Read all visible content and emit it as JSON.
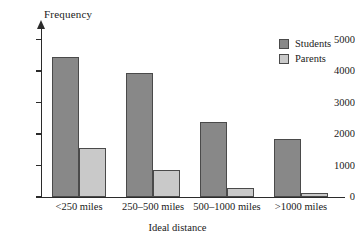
{
  "chart_data": {
    "type": "bar",
    "title": "",
    "xlabel": "Ideal distance",
    "ylabel": "Frequency",
    "categories": [
      "<250 miles",
      "250–500 miles",
      "500–1000 miles",
      ">1000 miles"
    ],
    "series": [
      {
        "name": "Students",
        "color": "#888888",
        "values": [
          4450,
          3930,
          2380,
          1840
        ]
      },
      {
        "name": "Parents",
        "color": "#c9c9c9",
        "values": [
          1570,
          860,
          300,
          130
        ]
      }
    ],
    "ylim": [
      0,
      5400
    ],
    "yticks": [
      0,
      1000,
      2000,
      3000,
      4000,
      5000
    ],
    "ytick_labels": [
      "0",
      "1000",
      "2000",
      "3000",
      "4000",
      "5000"
    ],
    "grid": false,
    "legend_position": "top-right",
    "legend_entries": [
      "Students",
      "Parents"
    ],
    "axis_color": "#2b2b2b",
    "background": "#ffffff"
  }
}
